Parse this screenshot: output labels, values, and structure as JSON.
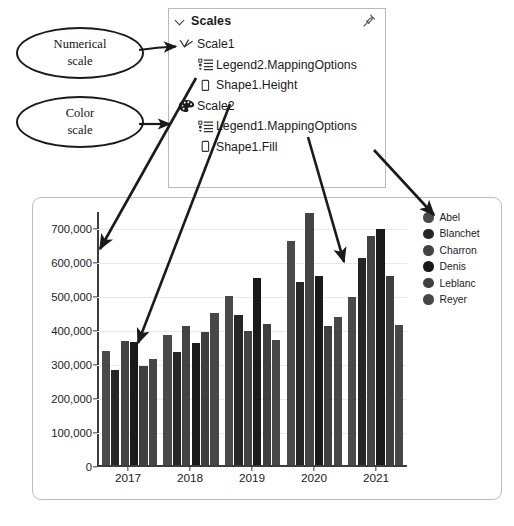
{
  "callouts": [
    {
      "name": "numerical-scale",
      "line1": "Numerical",
      "line2": "scale"
    },
    {
      "name": "color-scale",
      "line1": "Color",
      "line2": "scale"
    }
  ],
  "scales_panel": {
    "title": "Scales",
    "collapse_icon": "chevron-down-icon",
    "pin_icon": "pin-icon",
    "tree": [
      {
        "label": "Scale1",
        "icon": "numerical-scale-icon",
        "level": 1
      },
      {
        "label": "Legend2.MappingOptions",
        "icon": "mapping-options-icon",
        "level": 2
      },
      {
        "label": "Shape1.Height",
        "icon": "property-icon",
        "level": 2
      },
      {
        "label": "Scale2",
        "icon": "color-palette-icon",
        "level": 1
      },
      {
        "label": "Legend1.MappingOptions",
        "icon": "mapping-options-icon",
        "level": 2
      },
      {
        "label": "Shape1.Fill",
        "icon": "property-icon",
        "level": 2
      }
    ]
  },
  "chart_data": {
    "type": "bar",
    "title": "",
    "xlabel": "",
    "ylabel": "",
    "grid": true,
    "legend_position": "right",
    "ylim": [
      0,
      750000
    ],
    "yticks": [
      0,
      100000,
      200000,
      300000,
      400000,
      500000,
      600000,
      700000
    ],
    "ytick_labels": [
      "0",
      "100,000",
      "200,000",
      "300,000",
      "400,000",
      "500,000",
      "600,000",
      "700,000"
    ],
    "categories": [
      "2017",
      "2018",
      "2019",
      "2020",
      "2021"
    ],
    "series": [
      {
        "name": "Abel",
        "color": "#4a4a4a",
        "values": [
          336000,
          383000,
          499000,
          661000,
          496000
        ]
      },
      {
        "name": "Blanchet",
        "color": "#262626",
        "values": [
          280000,
          334000,
          441000,
          540000,
          611000
        ]
      },
      {
        "name": "Charron",
        "color": "#434343",
        "values": [
          366000,
          410000,
          395000,
          741000,
          676000
        ]
      },
      {
        "name": "Denis",
        "color": "#1a1a1a",
        "values": [
          363000,
          359000,
          552000,
          556000,
          694000
        ]
      },
      {
        "name": "Leblanc",
        "color": "#3f3f3f",
        "values": [
          292000,
          393000,
          415000,
          410000,
          557000
        ]
      },
      {
        "name": "Reyer",
        "color": "#474747",
        "values": [
          314000,
          447000,
          369000,
          437000,
          414000
        ]
      }
    ]
  }
}
